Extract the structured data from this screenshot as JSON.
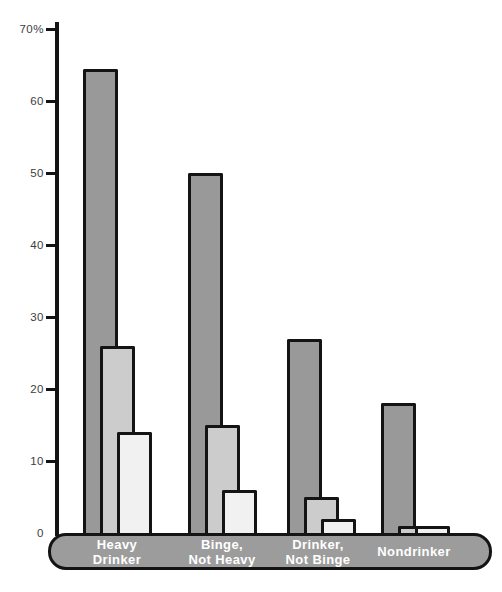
{
  "chart_data": {
    "type": "bar",
    "title": "",
    "xlabel": "",
    "ylabel": "",
    "categories": [
      "Heavy\nDrinker",
      "Binge,\nNot Heavy",
      "Drinker,\nNot Binge",
      "Nondrinker"
    ],
    "series": [
      {
        "name": "series-1-dark",
        "color": "#999999",
        "values": [
          64.5,
          50,
          27,
          18
        ]
      },
      {
        "name": "series-2-medium",
        "color": "#cccccc",
        "values": [
          26,
          15,
          5,
          1
        ]
      },
      {
        "name": "series-3-light",
        "color": "#f1f1f1",
        "values": [
          14,
          6,
          2,
          1
        ]
      }
    ],
    "ylim": [
      0,
      70
    ],
    "y_unit": "%",
    "y_ticks": [
      {
        "value": 70,
        "label": "70%",
        "tick": true
      },
      {
        "value": 60,
        "label": "60",
        "tick": true
      },
      {
        "value": 50,
        "label": "50",
        "tick": true
      },
      {
        "value": 40,
        "label": "40",
        "tick": true
      },
      {
        "value": 30,
        "label": "30",
        "tick": true
      },
      {
        "value": 20,
        "label": "20",
        "tick": true
      },
      {
        "value": 10,
        "label": "10",
        "tick": true
      },
      {
        "value": 0,
        "label": "0",
        "tick": false
      }
    ],
    "legend": "none",
    "grid": false,
    "bar_style": "overlapped",
    "colors": {
      "bar_outline": "#141414",
      "axis": "#141414",
      "band_fill": "#9c9c9c",
      "band_text": "#ffffff",
      "tick_text": "#3d3d3d",
      "background": "#ffffff"
    }
  }
}
